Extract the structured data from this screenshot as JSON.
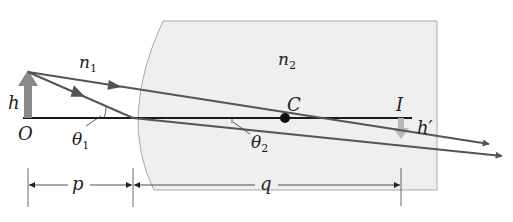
{
  "diagram": {
    "type": "refraction-at-spherical-surface",
    "colors": {
      "medium_fill": "#efefef",
      "medium_stroke": "#a9a9a9",
      "ray": "#555555",
      "axis": "#1a1a1a",
      "object_arrow": "#8a8a8a",
      "image_arrow": "#b8b8b8",
      "text": "#222222"
    },
    "labels": {
      "n1": "n",
      "n1_sub": "1",
      "n2": "n",
      "n2_sub": "2",
      "h": "h",
      "O": "O",
      "theta1": "θ",
      "theta1_sub": "1",
      "theta2": "θ",
      "theta2_sub": "2",
      "C": "C",
      "I": "I",
      "h_prime": "h′",
      "p": "p",
      "q": "q"
    },
    "points": {
      "object": [
        28,
        118
      ],
      "object_tip": [
        28,
        72
      ],
      "surface_vertex": [
        133,
        118
      ],
      "center_of_curvature": [
        285,
        118
      ],
      "image": [
        401,
        118
      ],
      "image_tip": [
        401,
        138
      ]
    },
    "rays": [
      {
        "name": "ray-through-center",
        "from": [
          28,
          72
        ],
        "to": [
          490,
          145
        ]
      },
      {
        "name": "ray-through-vertex",
        "from": [
          28,
          72
        ],
        "via": [
          133,
          118
        ],
        "to": [
          503,
          156
        ]
      }
    ],
    "dimensions": [
      {
        "label": "p",
        "from": 28,
        "to": 133,
        "y": 185
      },
      {
        "label": "q",
        "from": 133,
        "to": 401,
        "y": 185
      }
    ]
  }
}
